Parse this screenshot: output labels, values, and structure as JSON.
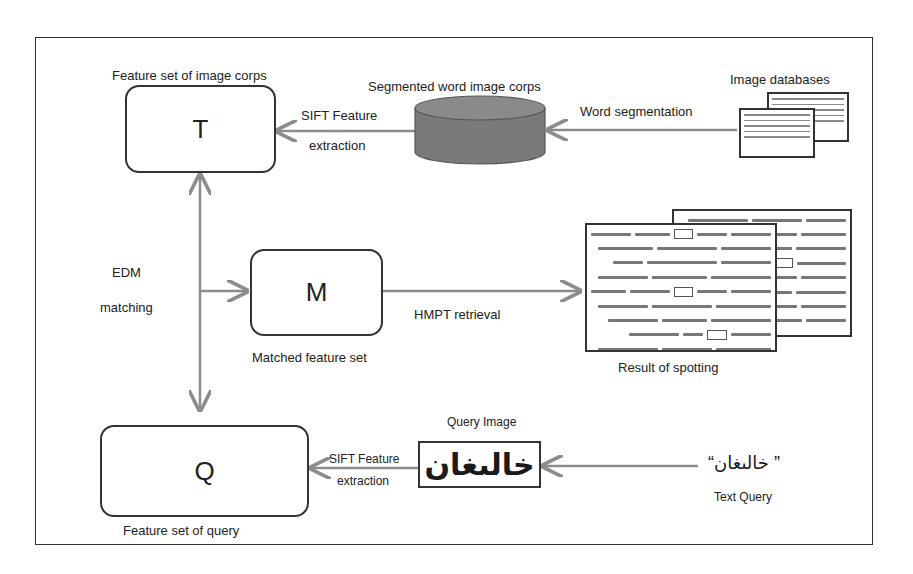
{
  "diagram": {
    "nodes": {
      "T": {
        "letter": "T",
        "caption": "Feature set of image corps"
      },
      "M": {
        "letter": "M",
        "caption": "Matched feature set"
      },
      "Q": {
        "letter": "Q",
        "caption": "Feature set of query"
      },
      "corpus": {
        "caption": "Segmented word image corps"
      },
      "databases": {
        "caption": "Image databases"
      },
      "result": {
        "caption": "Result of spotting"
      },
      "query_image": {
        "caption": "Query Image",
        "word": "خالىغان"
      },
      "text_query": {
        "caption": "Text Query",
        "text": "” خالىغان“"
      }
    },
    "edges": {
      "db_to_corpus": {
        "label": "Word segmentation"
      },
      "corpus_to_T": {
        "label_line1": "SIFT Feature",
        "label_line2": "extraction"
      },
      "query_to_Q": {
        "label_line1": "SIFT Feature",
        "label_line2": "extraction"
      },
      "edm": {
        "label_line1": "EDM",
        "label_line2": "matching"
      },
      "M_to_result": {
        "label": "HMPT retrieval"
      }
    },
    "colors": {
      "arrow": "#8c8c8c",
      "border": "#333333",
      "cylinder": "#7a7a7a"
    }
  }
}
